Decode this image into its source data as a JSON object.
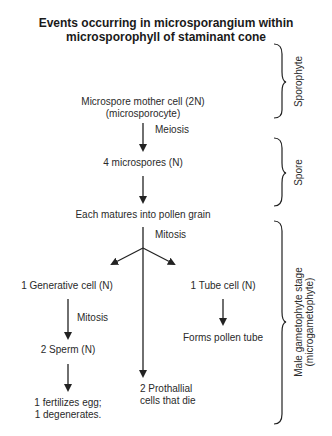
{
  "title": {
    "line1": "Events occurring in microsporangium within",
    "line2": "microsporophyll of staminant cone"
  },
  "nodes": {
    "mother_cell": {
      "line1": "Microspore mother cell (2N)",
      "line2": "(microsporocyte)"
    },
    "microspores": "4 microspores (N)",
    "pollen": "Each matures into pollen grain",
    "generative": "1 Generative cell (N)",
    "tube": "1 Tube cell (N)",
    "sperm": "2 Sperm (N)",
    "pollen_tube": "Forms pollen tube",
    "fertilize": {
      "line1": "1 fertilizes egg;",
      "line2": "1 degenerates."
    },
    "prothallial": {
      "line1": "2 Prothallial",
      "line2": "cells that die"
    }
  },
  "edges": {
    "meiosis": "Meiosis",
    "mitosis1": "Mitosis",
    "mitosis2": "Mitosis"
  },
  "stages": {
    "sporophyte": "Sporophyte",
    "spore": "Spore",
    "gametophyte": {
      "line1": "Male gametophyte stage",
      "line2": "(microgametophyte)"
    }
  }
}
